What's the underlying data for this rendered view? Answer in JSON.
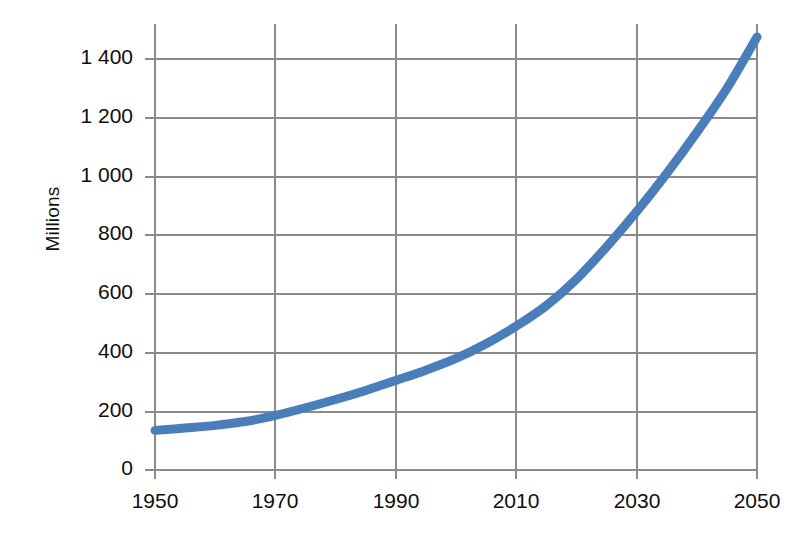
{
  "chart_data": {
    "type": "line",
    "title": "",
    "subtitle": "",
    "xlabel": "",
    "ylabel": "Millions",
    "xlim": [
      1950,
      2050
    ],
    "ylim": [
      0,
      1400
    ],
    "grid": true,
    "legend": "none",
    "axis": {
      "y_ticks": [
        "0",
        "200",
        "400",
        "600",
        "800",
        "1 000",
        "1 200",
        "1 400"
      ],
      "y_tick_values": [
        0,
        200,
        400,
        600,
        800,
        1000,
        1200,
        1400
      ],
      "x_ticks": [
        "1950",
        "1970",
        "1990",
        "2010",
        "2030",
        "2050"
      ],
      "x_tick_values": [
        1950,
        1970,
        1990,
        2010,
        2030,
        2050
      ]
    },
    "series": [
      {
        "name": "Millions",
        "color": "#4a7ebb",
        "line_width": 9,
        "smooth": true,
        "x": [
          1950,
          1955,
          1960,
          1965,
          1970,
          1975,
          1980,
          1985,
          1990,
          1995,
          2000,
          2005,
          2010,
          2015,
          2020,
          2025,
          2030,
          2035,
          2040,
          2045,
          2050
        ],
        "values": [
          135,
          143,
          152,
          165,
          186,
          212,
          240,
          271,
          305,
          340,
          380,
          430,
          490,
          560,
          650,
          760,
          880,
          1010,
          1150,
          1300,
          1475
        ]
      }
    ]
  },
  "figure": {
    "plot_area": {
      "left": 155,
      "top": 59,
      "right": 757,
      "bottom": 470
    },
    "colors": {
      "series": "#4a7ebb",
      "grid": "#808080",
      "axis": "#808080",
      "text": "#0e0e0e",
      "background": "#ffffff"
    }
  }
}
